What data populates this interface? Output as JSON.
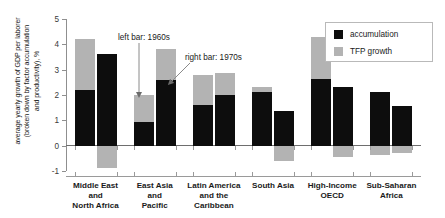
{
  "chart_data": {
    "type": "bar",
    "title": "",
    "subtitle": "",
    "xlabel": "",
    "ylabel": "average yearly growth of GDP per laborer (broken down by factor accumulation and productivity), %",
    "ylim": [
      -1,
      5
    ],
    "yticks": [
      -1,
      0,
      1,
      2,
      3,
      4,
      5
    ],
    "ytick_labels": [
      "-1",
      "0",
      "1",
      "2",
      "3",
      "4",
      "5"
    ],
    "grid": false,
    "legend_position": "top-right",
    "stacked": true,
    "categories": [
      "Middle East and North Africa",
      "East Asia and Pacific",
      "Latin America and the Caribbean",
      "South Asia",
      "High-Income OECD",
      "Sub-Saharan Africa"
    ],
    "category_label_lines": [
      [
        "Middle East",
        "and",
        "North Africa"
      ],
      [
        "East Asia",
        "and",
        "Pacific"
      ],
      [
        "Latin America",
        "and the",
        "Caribbean"
      ],
      [
        "South Asia"
      ],
      [
        "High-Income",
        "OECD"
      ],
      [
        "Sub-Saharan",
        "Africa"
      ]
    ],
    "bar_groups": [
      {
        "name": "1960s",
        "note": "left bar"
      },
      {
        "name": "1970s",
        "note": "right bar"
      }
    ],
    "series": [
      {
        "name": "accumulation",
        "color": "#0d0d0d",
        "values_1960s": [
          2.2,
          0.95,
          1.6,
          2.1,
          2.65,
          2.1
        ],
        "values_1970s": [
          3.6,
          2.6,
          2.0,
          1.35,
          2.3,
          1.55
        ]
      },
      {
        "name": "TFP growth",
        "color": "#b3b3b3",
        "values_1960s": [
          2.0,
          1.05,
          1.2,
          0.2,
          1.65,
          -0.35
        ],
        "values_1970s": [
          -0.9,
          1.2,
          0.85,
          -0.6,
          -0.45,
          -0.3
        ]
      }
    ],
    "totals_1960s": [
      4.2,
      2.0,
      2.8,
      2.3,
      4.3,
      1.75
    ],
    "totals_1970s": [
      2.7,
      3.8,
      2.85,
      0.75,
      1.85,
      1.25
    ],
    "annotations": [
      {
        "text": "left bar: 1960s",
        "target": "East Asia and Pacific 1960s bar"
      },
      {
        "text": "right bar: 1970s",
        "target": "East Asia and Pacific 1970s bar"
      }
    ]
  },
  "legend": {
    "items": [
      {
        "label": "accumulation",
        "color": "#0d0d0d"
      },
      {
        "label": "TFP growth",
        "color": "#b3b3b3"
      }
    ]
  },
  "axis": {
    "y_title": "average yearly growth of GDP per laborer (broken down by factor accumulation and productivity), %",
    "y_title_lines": [
      "average yearly growth of GDP per laborer",
      "(broken down by factor accumulation",
      "and productivity), %"
    ],
    "y_tick_labels": [
      "5",
      "4",
      "3",
      "2",
      "1",
      "0",
      "-1"
    ]
  },
  "annotations": {
    "left": "left bar: 1960s",
    "right": "right bar: 1970s"
  },
  "colors": {
    "accumulation": "#0d0d0d",
    "tfp_growth": "#b3b3b3",
    "axis": "#8f8f8f",
    "background": "#ffffff"
  }
}
